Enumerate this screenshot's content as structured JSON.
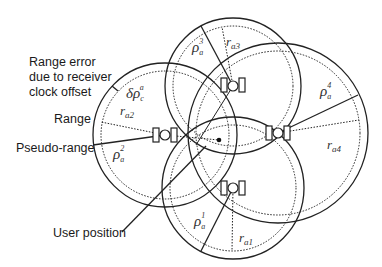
{
  "labels": {
    "range_error_line1": "Range error",
    "range_error_line2": "due to receiver",
    "range_error_line3": "clock offset",
    "range": "Range",
    "pseudo_range": "Pseudo-range",
    "user_position": "User position"
  },
  "symbols": {
    "clock_error": {
      "main": "δρ",
      "sub": "c",
      "sup": "a"
    },
    "rho1": {
      "main": "ρ",
      "sub": "a",
      "sup": "1"
    },
    "rho2": {
      "main": "ρ",
      "sub": "a",
      "sup": "2"
    },
    "rho3": {
      "main": "ρ",
      "sub": "a",
      "sup": "3"
    },
    "rho4": {
      "main": "ρ",
      "sub": "a",
      "sup": "4"
    },
    "r1": {
      "main": "r",
      "sub": "a1"
    },
    "r2": {
      "main": "r",
      "sub": "a2"
    },
    "r3": {
      "main": "r",
      "sub": "a3"
    },
    "r4": {
      "main": "r",
      "sub": "a4"
    }
  },
  "satellites": [
    {
      "id": 1,
      "icon": "satellite-icon",
      "cx": 233,
      "cy": 188,
      "pseudo_range_radius": 71
    },
    {
      "id": 2,
      "icon": "satellite-icon",
      "cx": 165,
      "cy": 135,
      "pseudo_range_radius": 72
    },
    {
      "id": 3,
      "icon": "satellite-icon",
      "cx": 233,
      "cy": 86,
      "pseudo_range_radius": 68
    },
    {
      "id": 4,
      "icon": "satellite-icon",
      "cx": 278,
      "cy": 133,
      "pseudo_range_radius": 90
    }
  ],
  "user_position": {
    "x": 219,
    "y": 140
  },
  "colors": {
    "stroke": "#222222",
    "text": "#1a1a1a",
    "background": "#ffffff"
  }
}
